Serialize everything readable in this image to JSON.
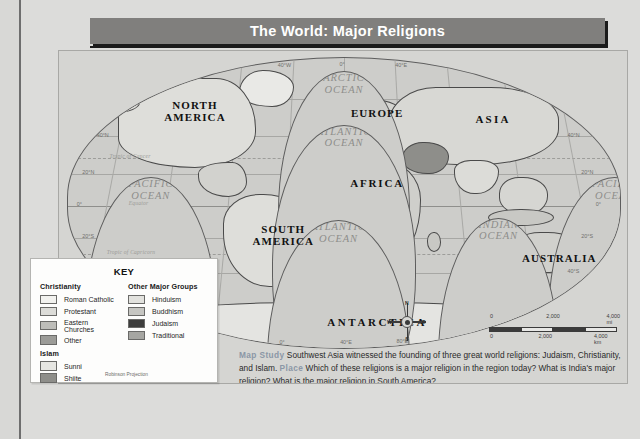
{
  "title": "The World: Major Religions",
  "map": {
    "projection_note": "Robinson Projection",
    "continents": [
      {
        "name": "NORTH\nAMERICA"
      },
      {
        "name": "SOUTH\nAMERICA"
      },
      {
        "name": "EUROPE"
      },
      {
        "name": "ASIA"
      },
      {
        "name": "AFRICA"
      },
      {
        "name": "AUSTRALIA"
      },
      {
        "name": "ANTARCTICA"
      }
    ],
    "labels": {
      "north_america": "NORTH\nAMERICA",
      "south_america": "SOUTH\nAMERICA",
      "europe": "EUROPE",
      "asia": "ASIA",
      "africa": "AFRICA",
      "australia": "AUSTRALIA",
      "antarctica": "ANTARCTICA",
      "arctic_ocean": "ARCTIC\nOCEAN",
      "atlantic_ocean_n": "ATLANTIC\nOCEAN",
      "atlantic_ocean_s": "ATLANTIC\nOCEAN",
      "pacific_ocean_w": "PACIFIC\nOCEAN",
      "pacific_ocean_e": "PACIFIC\nOCEAN",
      "indian_ocean": "INDIAN\nOCEAN",
      "arctic_circle": "Arctic Circle",
      "tropic_cancer": "Tropic of Cancer",
      "tropic_capricorn": "Tropic of Capricorn",
      "equator": "Equator"
    },
    "longitudes_top": [
      "160°W",
      "120°W",
      "80°W",
      "40°W",
      "0°",
      "40°E",
      "80°E",
      "120°E",
      "160°E"
    ],
    "longitudes_bottom": [
      "0°W",
      "80°W",
      "40°W",
      "0°",
      "40°E",
      "80°E",
      "120°E",
      "160°E"
    ],
    "latitudes_left": [
      "40°N",
      "20°N",
      "0°",
      "20°S"
    ],
    "latitudes_right": [
      "40°N",
      "20°N",
      "0°",
      "20°S",
      "40°S",
      "60°S"
    ],
    "compass": {
      "n": "N",
      "s": "S",
      "e": "E",
      "w": "W"
    },
    "scale": {
      "miles": {
        "ticks": [
          "0",
          "2,000",
          "4,000 mi"
        ]
      },
      "km": {
        "ticks": [
          "0",
          "2,000",
          "4,000 km"
        ]
      }
    }
  },
  "key": {
    "title": "KEY",
    "groups": [
      {
        "heading": "Christianity",
        "items": [
          {
            "label": "Roman Catholic",
            "color": "#f2f2ef"
          },
          {
            "label": "Protestant",
            "color": "#dcdcd8"
          },
          {
            "label": "Eastern Churches",
            "color": "#bdbdb9"
          },
          {
            "label": "Other",
            "color": "#9c9c98"
          }
        ]
      },
      {
        "heading": "Islam",
        "items": [
          {
            "label": "Sunni",
            "color": "#e6e6e2"
          },
          {
            "label": "Shiite",
            "color": "#8e8e8a"
          }
        ]
      },
      {
        "heading": "Other Major Groups",
        "items": [
          {
            "label": "Hinduism",
            "color": "#e2e2de"
          },
          {
            "label": "Buddhism",
            "color": "#c6c6c2"
          },
          {
            "label": "Judaism",
            "color": "#3d3d3c"
          },
          {
            "label": "Traditional",
            "color": "#a6a6a2"
          }
        ]
      }
    ],
    "projection": "Robinson Projection"
  },
  "caption": {
    "lead": "Map Study",
    "text1": " Southwest Asia witnessed the founding of three great world religions: Judaism, Christianity, and Islam. ",
    "lead2": "Place",
    "text2": " Which of these religions is a major religion in the region today? What is India's major religion? What is the major religion in South America?"
  }
}
